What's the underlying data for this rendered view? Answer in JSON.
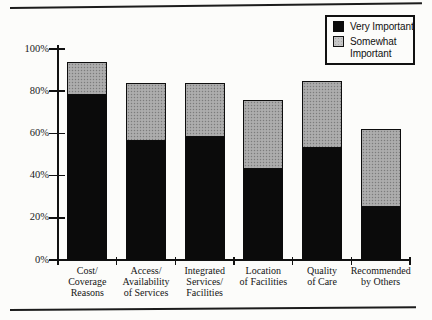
{
  "legend": {
    "items": [
      {
        "label": "Very Important",
        "color": "#0b0b0b"
      },
      {
        "label": "Somewhat Important",
        "lines": [
          "Somewhat",
          "Important"
        ],
        "color": "#c6c6c6"
      }
    ]
  },
  "chart_data": {
    "type": "bar",
    "stacked": true,
    "title": "",
    "xlabel": "",
    "ylabel": "",
    "categories": [
      "Cost/Coverage Reasons",
      "Access/Availability of Services",
      "Integrated Services/Facilities",
      "Location of Facilities",
      "Quality of Care",
      "Recommended by Others"
    ],
    "category_label_lines": [
      [
        "Cost/",
        "Coverage",
        "Reasons"
      ],
      [
        "Access/",
        "Availability",
        "of Services"
      ],
      [
        "Integrated",
        "Services/",
        "Facilities"
      ],
      [
        "Location",
        "of Facilities"
      ],
      [
        "Quality",
        "of Care"
      ],
      [
        "Recommended",
        "by Others"
      ]
    ],
    "series": [
      {
        "name": "Very Important",
        "values": [
          79,
          57,
          59,
          44,
          54,
          26
        ],
        "color": "#0b0b0b"
      },
      {
        "name": "Somewhat Important",
        "values": [
          15,
          27,
          25,
          32,
          31,
          36
        ],
        "color": "#a6a6a6"
      }
    ],
    "stack_totals": [
      94,
      84,
      84,
      76,
      85,
      62
    ],
    "yticks": [
      "0%",
      "20%",
      "40%",
      "60%",
      "80%",
      "100%"
    ],
    "ytick_values": [
      0,
      20,
      40,
      60,
      80,
      100
    ],
    "ylim": [
      0,
      100
    ],
    "grid": false,
    "legend_position": "top-right"
  }
}
